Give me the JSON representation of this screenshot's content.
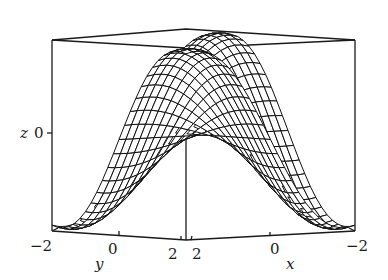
{
  "chart_data": {
    "type": "surface3d",
    "title": "",
    "function_description": "saddle-like wireframe surface over x in [-2,2], y in [-2,2]",
    "xlabel": "x",
    "ylabel": "y",
    "zlabel": "z",
    "x_range": [
      -2,
      2
    ],
    "y_range": [
      -2,
      2
    ],
    "x_ticks": [
      "2",
      "0",
      "−2"
    ],
    "y_ticks": [
      "−2",
      "0",
      "2"
    ],
    "z_ticks": [
      "0"
    ],
    "grid_lines_per_axis": 24,
    "box": true,
    "style": "black wireframe mesh on white"
  },
  "labels": {
    "z_axis": "z",
    "z_tick_0": "0",
    "y_axis": "y",
    "y_tick_neg2": "−2",
    "y_tick_0": "0",
    "y_tick_2": "2",
    "x_axis": "x",
    "x_tick_2": "2",
    "x_tick_0": "0",
    "x_tick_neg2": "−2"
  },
  "colors": {
    "line": "#111111",
    "background": "#ffffff"
  }
}
